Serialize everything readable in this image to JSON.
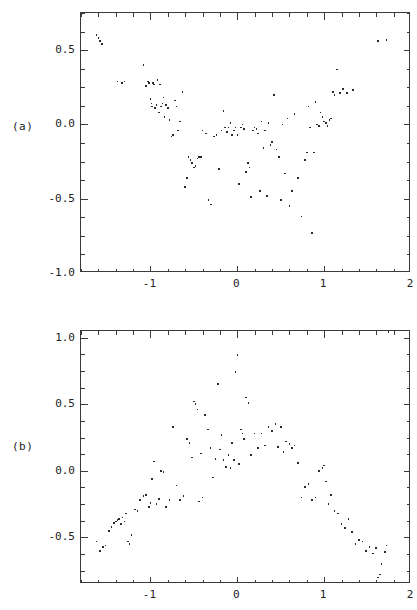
{
  "figure": {
    "panels": [
      {
        "label": "(a)",
        "label_name": "panel-a-label",
        "frame": {
          "left": 80,
          "top": 12,
          "width": 330,
          "height": 260
        },
        "xaxis": {
          "min": -1.8,
          "max": 2.0,
          "ticks": [
            -1,
            0,
            1,
            2
          ],
          "tick_labels": [
            "-1",
            "0",
            "1",
            "2"
          ],
          "minor_step": 0.2
        },
        "yaxis": {
          "min": -1.0,
          "max": 0.75,
          "ticks": [
            0.5,
            0.0,
            -0.5,
            -1.0
          ],
          "tick_labels": [
            "0.5",
            "0.0",
            "-0.5",
            "-1.0"
          ],
          "minor_step": 0.125
        }
      },
      {
        "label": "(b)",
        "label_name": "panel-b-label",
        "frame": {
          "left": 80,
          "top": 330,
          "width": 330,
          "height": 253
        },
        "xaxis": {
          "min": -1.8,
          "max": 2.0,
          "ticks": [
            -1,
            0,
            1,
            2
          ],
          "tick_labels": [
            "-1",
            "0",
            "1",
            "2"
          ],
          "minor_step": 0.2
        },
        "yaxis": {
          "min": -0.85,
          "max": 1.05,
          "ticks": [
            1.0,
            0.5,
            0.0,
            -0.5
          ],
          "tick_labels": [
            "1.0",
            "0.5",
            "0.0",
            "-0.5"
          ],
          "minor_step": 0.125
        }
      }
    ]
  },
  "chart_data": [
    {
      "type": "scatter",
      "title": "",
      "panel": "(a)",
      "xlabel": "",
      "ylabel": "",
      "xlim": [
        -1.8,
        2.0
      ],
      "ylim": [
        -1.0,
        0.75
      ],
      "grid": false,
      "legend": "none",
      "marker": "dot",
      "x": [
        -1.62,
        -1.6,
        -1.58,
        -1.56,
        -1.38,
        -1.33,
        -1.3,
        -1.08,
        -1.05,
        -1.03,
        -1.02,
        -1.0,
        -0.99,
        -0.98,
        -0.97,
        -0.96,
        -0.95,
        -0.93,
        -0.92,
        -0.9,
        -0.89,
        -0.88,
        -0.86,
        -0.85,
        -0.84,
        -0.82,
        -0.8,
        -0.78,
        -0.76,
        -0.74,
        -0.72,
        -0.7,
        -0.68,
        -0.66,
        -0.63,
        -0.6,
        -0.58,
        -0.56,
        -0.54,
        -0.52,
        -0.5,
        -0.48,
        -0.46,
        -0.44,
        -0.42,
        -0.4,
        -0.36,
        -0.33,
        -0.3,
        -0.27,
        -0.24,
        -0.21,
        -0.18,
        -0.16,
        -0.14,
        -0.12,
        -0.1,
        -0.08,
        -0.06,
        -0.04,
        -0.02,
        0.0,
        0.02,
        0.04,
        0.06,
        0.08,
        0.1,
        0.12,
        0.14,
        0.16,
        0.18,
        0.2,
        0.22,
        0.24,
        0.26,
        0.28,
        0.3,
        0.32,
        0.34,
        0.36,
        0.38,
        0.4,
        0.42,
        0.45,
        0.48,
        0.5,
        0.52,
        0.55,
        0.58,
        0.6,
        0.63,
        0.66,
        0.7,
        0.74,
        0.78,
        0.8,
        0.82,
        0.84,
        0.86,
        0.88,
        0.9,
        0.92,
        0.94,
        0.96,
        0.98,
        1.0,
        1.02,
        1.04,
        1.06,
        1.08,
        1.1,
        1.12,
        1.15,
        1.18,
        1.22,
        1.26,
        1.33,
        1.62,
        1.72
      ],
      "y": [
        0.6,
        0.58,
        0.56,
        0.54,
        0.29,
        0.28,
        0.29,
        0.4,
        0.26,
        0.29,
        0.28,
        0.17,
        0.14,
        0.12,
        0.28,
        0.27,
        0.11,
        0.13,
        0.3,
        0.08,
        0.27,
        0.12,
        0.14,
        0.18,
        0.05,
        0.13,
        0.11,
        0.03,
        -0.08,
        -0.07,
        0.16,
        0.12,
        -0.04,
        0.02,
        0.22,
        -0.42,
        -0.36,
        -0.22,
        -0.24,
        -0.26,
        -0.29,
        -0.28,
        -0.23,
        -0.22,
        -0.22,
        -0.04,
        -0.06,
        -0.51,
        -0.54,
        -0.08,
        -0.07,
        -0.3,
        -0.04,
        0.09,
        -0.02,
        -0.05,
        -0.02,
        0.01,
        -0.07,
        -0.04,
        -0.02,
        -0.07,
        -0.4,
        -0.02,
        0.0,
        -0.03,
        -0.32,
        -0.26,
        -0.29,
        -0.49,
        -0.04,
        -0.02,
        -0.03,
        -0.06,
        -0.45,
        0.02,
        -0.16,
        -0.04,
        -0.48,
        0.01,
        -0.14,
        -0.12,
        0.2,
        -0.17,
        -0.22,
        -0.51,
        0.0,
        -0.33,
        0.04,
        -0.55,
        -0.45,
        0.07,
        -0.36,
        -0.62,
        -0.24,
        -0.19,
        0.12,
        -0.02,
        -0.73,
        -0.19,
        0.15,
        0.0,
        -0.01,
        0.08,
        0.05,
        0.02,
        0.01,
        -0.01,
        0.03,
        0.04,
        0.22,
        0.2,
        0.37,
        0.21,
        0.24,
        0.21,
        0.23,
        0.56,
        0.57
      ],
      "n_points": 118
    },
    {
      "type": "scatter",
      "title": "",
      "panel": "(b)",
      "xlabel": "",
      "ylabel": "",
      "xlim": [
        -1.8,
        2.0
      ],
      "ylim": [
        -0.85,
        1.05
      ],
      "grid": false,
      "legend": "none",
      "marker": "dot",
      "x": [
        -1.62,
        -1.58,
        -1.55,
        -1.52,
        -1.48,
        -1.45,
        -1.42,
        -1.4,
        -1.38,
        -1.36,
        -1.34,
        -1.32,
        -1.3,
        -1.28,
        -1.26,
        -1.24,
        -1.22,
        -1.18,
        -1.15,
        -1.12,
        -1.08,
        -1.05,
        -1.02,
        -1.0,
        -0.98,
        -0.96,
        -0.93,
        -0.9,
        -0.88,
        -0.85,
        -0.82,
        -0.78,
        -0.74,
        -0.7,
        -0.66,
        -0.62,
        -0.58,
        -0.55,
        -0.52,
        -0.5,
        -0.48,
        -0.46,
        -0.44,
        -0.42,
        -0.4,
        -0.37,
        -0.34,
        -0.31,
        -0.28,
        -0.25,
        -0.22,
        -0.2,
        -0.18,
        -0.16,
        -0.13,
        -0.1,
        -0.08,
        -0.06,
        -0.04,
        -0.02,
        0.0,
        0.02,
        0.04,
        0.06,
        0.08,
        0.1,
        0.13,
        0.16,
        0.2,
        0.24,
        0.28,
        0.32,
        0.36,
        0.4,
        0.44,
        0.47,
        0.5,
        0.53,
        0.56,
        0.6,
        0.63,
        0.66,
        0.7,
        0.74,
        0.78,
        0.82,
        0.86,
        0.9,
        0.94,
        0.98,
        1.0,
        1.02,
        1.05,
        1.08,
        1.12,
        1.16,
        1.2,
        1.24,
        1.28,
        1.32,
        1.36,
        1.4,
        1.44,
        1.48,
        1.52,
        1.56,
        1.6,
        1.62,
        1.64,
        1.66,
        1.7,
        1.72,
        1.74
      ],
      "y": [
        -0.53,
        -0.6,
        -0.57,
        -0.56,
        -0.45,
        -0.42,
        -0.39,
        -0.38,
        -0.37,
        -0.36,
        -0.4,
        -0.35,
        -0.38,
        -0.32,
        -0.53,
        -0.55,
        -0.48,
        -0.29,
        -0.3,
        -0.22,
        -0.19,
        -0.18,
        -0.27,
        -0.24,
        -0.06,
        0.07,
        -0.25,
        -0.21,
        0.0,
        -0.01,
        -0.27,
        -0.22,
        0.33,
        -0.11,
        -0.22,
        -0.19,
        0.24,
        0.21,
        0.1,
        0.52,
        0.5,
        0.46,
        -0.23,
        0.13,
        -0.2,
        0.42,
        0.31,
        0.17,
        -0.05,
        0.09,
        0.65,
        0.16,
        0.27,
        0.08,
        0.03,
        0.12,
        0.02,
        0.21,
        0.08,
        0.74,
        0.87,
        0.05,
        0.31,
        0.28,
        0.24,
        0.55,
        0.51,
        0.12,
        0.28,
        0.17,
        0.28,
        0.19,
        0.33,
        0.3,
        0.35,
        0.18,
        0.33,
        0.14,
        0.22,
        0.2,
        0.17,
        0.19,
        0.06,
        -0.2,
        -0.12,
        -0.1,
        -0.22,
        -0.2,
        0.0,
        0.02,
        0.04,
        -0.08,
        -0.25,
        -0.18,
        -0.3,
        -0.32,
        -0.4,
        -0.43,
        -0.36,
        -0.46,
        -0.55,
        -0.52,
        -0.53,
        -0.6,
        -0.57,
        -0.62,
        -0.58,
        -0.8,
        -0.78,
        -0.7,
        -0.61,
        -0.56
      ],
      "n_points": 113
    }
  ]
}
